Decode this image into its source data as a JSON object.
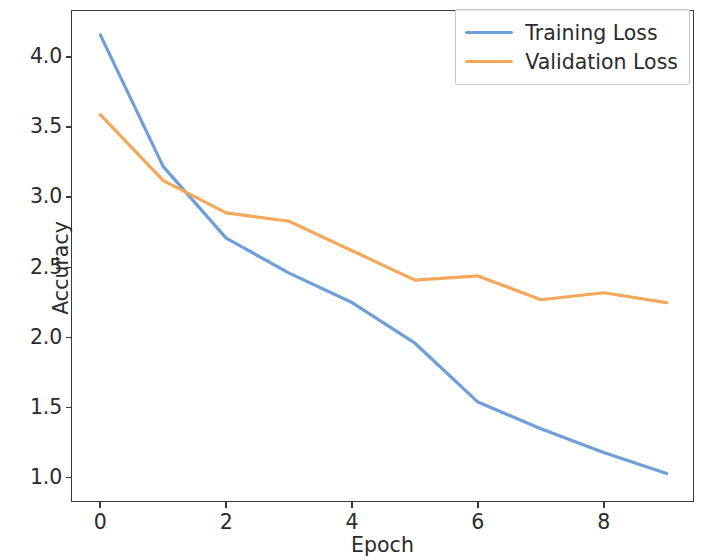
{
  "chart_data": {
    "type": "line",
    "title": "",
    "xlabel": "Epoch",
    "ylabel": "Accuracy",
    "x": [
      0,
      1,
      2,
      3,
      4,
      5,
      6,
      7,
      8,
      9
    ],
    "xlim": [
      -0.45,
      9.45
    ],
    "ylim": [
      0.82,
      4.33
    ],
    "xticks": [
      0,
      2,
      4,
      6,
      8
    ],
    "xticklabels": [
      "0",
      "2",
      "4",
      "6",
      "8"
    ],
    "yticks": [
      1.0,
      1.5,
      2.0,
      2.5,
      3.0,
      3.5,
      4.0
    ],
    "yticklabels": [
      "1.0",
      "1.5",
      "2.0",
      "2.5",
      "3.0",
      "3.5",
      "4.0"
    ],
    "grid": false,
    "legend_position": "upper right",
    "legend_frame": true,
    "series": [
      {
        "name": "Training Loss",
        "color": "#6f9fd8",
        "values": [
          4.16,
          3.22,
          2.71,
          2.46,
          2.25,
          1.96,
          1.54,
          1.35,
          1.18,
          1.03
        ]
      },
      {
        "name": "Validation Loss",
        "color": "#f5a85a",
        "values": [
          3.59,
          3.12,
          2.89,
          2.83,
          2.62,
          2.41,
          2.44,
          2.27,
          2.32,
          2.25
        ]
      }
    ]
  }
}
